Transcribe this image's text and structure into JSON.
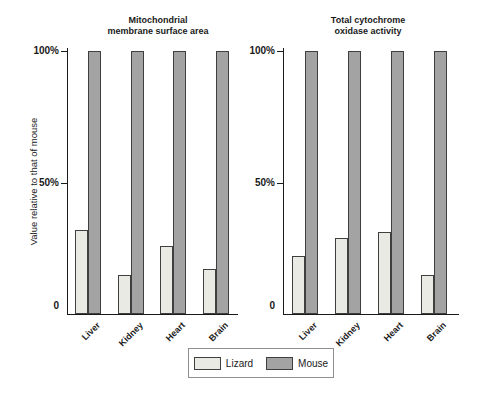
{
  "figure": {
    "y_axis_label": "Value relative to that of mouse",
    "y_ticks": [
      {
        "value": 100,
        "label": "100%"
      },
      {
        "value": 50,
        "label": "50%"
      },
      {
        "value": 0,
        "label": "0"
      }
    ],
    "legend": [
      {
        "label": "Lizard",
        "color": "#eaeae5"
      },
      {
        "label": "Mouse",
        "color": "#a3a3a3"
      }
    ]
  },
  "chart_data": [
    {
      "type": "bar",
      "title": "Mitochondrial membrane surface area",
      "title_lines": [
        "Mitochondrial",
        "membrane surface area"
      ],
      "categories": [
        "Liver",
        "Kidney",
        "Heart",
        "Brain"
      ],
      "series": [
        {
          "name": "Lizard",
          "values": [
            32,
            15,
            26,
            17
          ]
        },
        {
          "name": "Mouse",
          "values": [
            100,
            100,
            100,
            100
          ]
        }
      ],
      "xlabel": "",
      "ylabel": "Value relative to that of mouse",
      "ylim": [
        0,
        100
      ],
      "yticks": [
        0,
        50,
        100
      ],
      "grid": false,
      "legend_position": "bottom"
    },
    {
      "type": "bar",
      "title": "Total cytochrome oxidase activity",
      "title_lines": [
        "Total cytochrome",
        "oxidase activity"
      ],
      "categories": [
        "Liver",
        "Kidney",
        "Heart",
        "Brain"
      ],
      "series": [
        {
          "name": "Lizard",
          "values": [
            22,
            29,
            31,
            15
          ]
        },
        {
          "name": "Mouse",
          "values": [
            100,
            100,
            100,
            100
          ]
        }
      ],
      "xlabel": "",
      "ylabel": "Value relative to that of mouse",
      "ylim": [
        0,
        100
      ],
      "yticks": [
        0,
        50,
        100
      ],
      "grid": false,
      "legend_position": "bottom"
    }
  ],
  "colors": {
    "lizard_fill": "#eaeae5",
    "mouse_fill": "#a3a3a3",
    "bar_border": "#3f3f3f",
    "axis": "#1a1a1a",
    "text": "#1a1a1a",
    "legend_border": "#8f8f8f",
    "background": "#ffffff"
  }
}
